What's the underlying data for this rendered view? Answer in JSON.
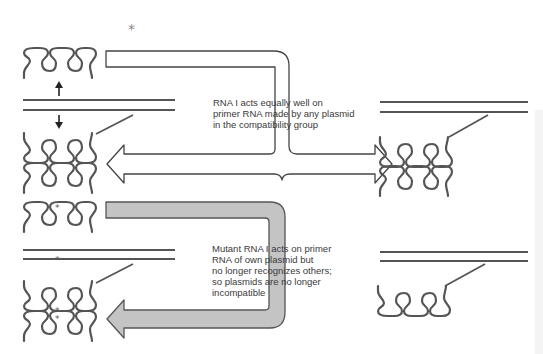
{
  "figure": {
    "type": "plasmid incompatibility diagram",
    "panels": [
      {
        "id": "wild-type",
        "arrow_style": "white",
        "caption_lines": [
          "RNA I acts equally well on",
          "primer RNA made by any plasmid",
          "in the compatibility group"
        ],
        "arrow_targets": [
          "own plasmid (left)",
          "other plasmid (right)"
        ]
      },
      {
        "id": "mutant",
        "arrow_style": "gray",
        "caption_lines": [
          "Mutant RNA I acts on primer",
          "RNA of own plasmid but",
          "no longer recognizes others;",
          "so plasmids are no longer",
          "incompatible"
        ],
        "arrow_targets": [
          "own plasmid (left)"
        ]
      }
    ],
    "markers": {
      "mutation_symbol": "*"
    },
    "colors": {
      "line": "#555555",
      "gray_arrow_fill": "#c4c4c4",
      "white_arrow_fill": "#ffffff",
      "text": "#3a3a3a"
    }
  }
}
